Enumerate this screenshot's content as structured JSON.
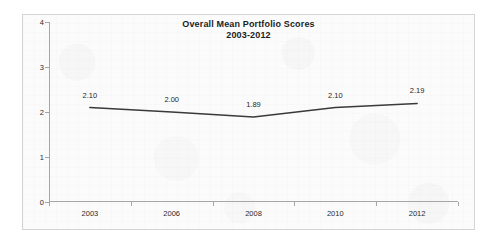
{
  "chart_data": {
    "type": "line",
    "title": "Overall Mean Portfolio Scores",
    "subtitle": "2003-2012",
    "xlabel": "",
    "ylabel": "",
    "categories": [
      "2003",
      "2006",
      "2008",
      "2010",
      "2012"
    ],
    "values": [
      2.1,
      2.0,
      1.89,
      2.1,
      2.19
    ],
    "point_labels": [
      "2.10",
      "2.00",
      "1.89",
      "2.10",
      "2.19"
    ],
    "ylim": [
      0,
      4
    ],
    "yticks": [
      0,
      1,
      2,
      3,
      4
    ],
    "ytick_labels": [
      "0",
      "1",
      "2",
      "3",
      "4"
    ],
    "grid": false,
    "legend": false,
    "series": [
      {
        "name": "Overall Mean Portfolio Score",
        "values": [
          2.1,
          2.0,
          1.89,
          2.1,
          2.19
        ],
        "color": "#3a3a3a"
      }
    ]
  },
  "colors": {
    "line": "#3a3a3a",
    "axis": "#a6a6a6",
    "border": "#d4d4d4",
    "plot_background": "#fbfbfb",
    "text": "#1f1f1f"
  }
}
